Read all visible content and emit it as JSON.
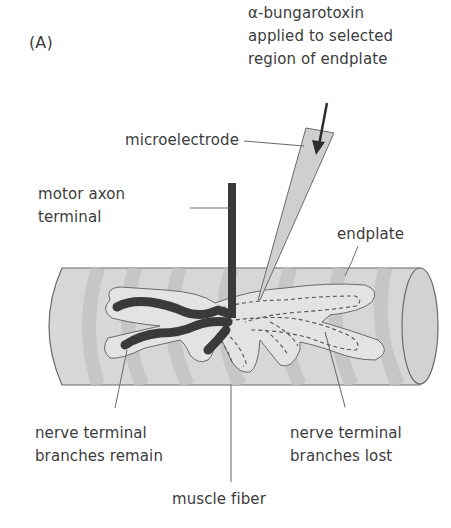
{
  "figure": {
    "panel_label": "(A)",
    "colors": {
      "background": "#ffffff",
      "muscle_fiber": "#d6d6d6",
      "muscle_stripe": "#c4c4c4",
      "endplate": "#dcdcdc",
      "nerve_terminal": "#3b3b3b",
      "microelectrode": "#cfcfcf",
      "outline": "#6a6a6a",
      "text": "#3c3c3c"
    }
  },
  "labels": {
    "toxin": {
      "line1": "α-bungarotoxin",
      "line2": "applied to selected",
      "line3": "region of endplate"
    },
    "microelectrode": "microelectrode",
    "motor_axon": {
      "line1": "motor axon",
      "line2": "terminal"
    },
    "endplate": "endplate",
    "branches_remain": {
      "line1": "nerve terminal",
      "line2": "branches remain"
    },
    "branches_lost": {
      "line1": "nerve terminal",
      "line2": "branches lost"
    },
    "muscle_fiber": "muscle fiber"
  }
}
